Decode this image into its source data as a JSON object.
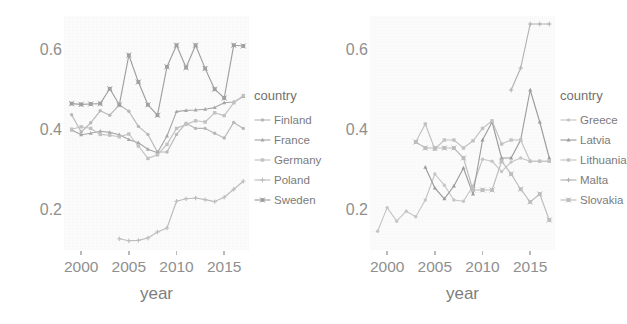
{
  "chart_data": [
    {
      "type": "line",
      "panel": "left",
      "title": "",
      "xlabel": "year",
      "ylabel": "Proportion of female MEPs",
      "legend_title": "country",
      "legend_position": "right",
      "grid": false,
      "xlim": [
        1998.2,
        2017.6
      ],
      "ylim": [
        0.1,
        0.685
      ],
      "xticks": [
        2000,
        2005,
        2010,
        2015
      ],
      "yticks": [
        0.2,
        0.4,
        0.6
      ],
      "x": [
        1999,
        2000,
        2001,
        2002,
        2003,
        2004,
        2005,
        2006,
        2007,
        2008,
        2009,
        2010,
        2011,
        2012,
        2013,
        2014,
        2015,
        2016,
        2017
      ],
      "series": [
        {
          "name": "Finland",
          "color": "#b8b8b8",
          "marker": "circle",
          "values": [
            0.438,
            0.395,
            0.418,
            0.448,
            0.437,
            0.463,
            0.447,
            0.409,
            0.389,
            0.345,
            0.345,
            0.389,
            0.417,
            0.404,
            0.404,
            0.392,
            0.38,
            0.419,
            0.404
          ]
        },
        {
          "name": "France",
          "color": "#a8a8a8",
          "marker": "triangle",
          "values": [
            0.4,
            0.388,
            0.392,
            0.397,
            0.394,
            0.388,
            0.376,
            0.368,
            0.352,
            0.343,
            0.385,
            0.446,
            0.449,
            0.45,
            0.452,
            0.456,
            0.468,
            0.47,
            0.484
          ]
        },
        {
          "name": "Germany",
          "color": "#c2c2c2",
          "marker": "square",
          "values": [
            0.402,
            0.408,
            0.404,
            0.389,
            0.387,
            0.383,
            0.39,
            0.36,
            0.329,
            0.338,
            0.364,
            0.404,
            0.414,
            0.423,
            0.42,
            0.443,
            0.436,
            0.468,
            0.486
          ]
        },
        {
          "name": "Poland",
          "color": "#bdbdbd",
          "marker": "plus",
          "values": [
            null,
            null,
            null,
            null,
            null,
            0.128,
            0.123,
            0.124,
            0.13,
            0.145,
            0.155,
            0.222,
            0.228,
            0.23,
            0.226,
            0.221,
            0.232,
            0.252,
            0.272
          ]
        },
        {
          "name": "Sweden",
          "color": "#a0a0a0",
          "marker": "square-cross",
          "values": [
            0.466,
            0.464,
            0.465,
            0.466,
            0.503,
            0.463,
            0.587,
            0.52,
            0.463,
            0.437,
            0.558,
            0.612,
            0.556,
            0.612,
            0.554,
            0.502,
            0.48,
            0.612,
            0.61
          ]
        }
      ]
    },
    {
      "type": "line",
      "panel": "right",
      "title": "",
      "xlabel": "year",
      "ylabel": "Proportion of female MEPs",
      "legend_title": "country",
      "legend_position": "right",
      "grid": false,
      "xlim": [
        1998.2,
        2017.6
      ],
      "ylim": [
        0.1,
        0.685
      ],
      "xticks": [
        2000,
        2005,
        2010,
        2015
      ],
      "yticks": [
        0.2,
        0.4,
        0.6
      ],
      "x": [
        1999,
        2000,
        2001,
        2002,
        2003,
        2004,
        2005,
        2006,
        2007,
        2008,
        2009,
        2010,
        2011,
        2012,
        2013,
        2014,
        2015,
        2016,
        2017
      ],
      "series": [
        {
          "name": "Greece",
          "color": "#c6c6c6",
          "marker": "circle",
          "values": [
            0.147,
            0.206,
            0.172,
            0.197,
            0.183,
            0.225,
            0.29,
            0.262,
            0.225,
            0.222,
            0.26,
            0.327,
            0.322,
            0.296,
            0.32,
            0.33,
            0.322,
            0.322,
            0.322
          ]
        },
        {
          "name": "Latvia",
          "color": "#9d9d9d",
          "marker": "triangle",
          "values": [
            null,
            null,
            null,
            null,
            null,
            0.307,
            0.255,
            0.228,
            0.26,
            0.305,
            0.24,
            0.375,
            0.42,
            0.33,
            0.33,
            0.375,
            0.5,
            0.42,
            0.33
          ]
        },
        {
          "name": "Lithuania",
          "color": "#c2c2c2",
          "marker": "square",
          "values": [
            null,
            null,
            null,
            null,
            0.37,
            0.415,
            0.352,
            0.375,
            0.375,
            0.355,
            0.373,
            0.404,
            0.423,
            0.365,
            0.375,
            0.375,
            0.322,
            0.322,
            0.322
          ]
        },
        {
          "name": "Malta",
          "color": "#b2b2b2",
          "marker": "plus",
          "values": [
            null,
            null,
            null,
            null,
            null,
            null,
            null,
            null,
            null,
            null,
            null,
            null,
            null,
            null,
            0.5,
            0.555,
            0.665,
            0.665,
            0.665
          ]
        },
        {
          "name": "Slovakia",
          "color": "#bdbdbd",
          "marker": "square-cross",
          "values": [
            null,
            null,
            null,
            null,
            0.37,
            0.355,
            0.355,
            0.355,
            0.355,
            0.33,
            0.25,
            0.25,
            0.25,
            0.322,
            0.29,
            0.252,
            0.22,
            0.24,
            0.175
          ]
        }
      ]
    }
  ],
  "panels": [
    {
      "id": "left-panel",
      "axis": {
        "y_title": "Proportion of female MEPs",
        "x_title": "year",
        "y_ticks": [
          "0.6",
          "0.4",
          "0.2"
        ],
        "x_ticks": [
          "2000",
          "2005",
          "2010",
          "2015"
        ]
      },
      "legend": {
        "title": "country",
        "items": [
          {
            "label": "Finland",
            "color": "#b8b8b8",
            "marker": "circle"
          },
          {
            "label": "France",
            "color": "#a8a8a8",
            "marker": "triangle"
          },
          {
            "label": "Germany",
            "color": "#c2c2c2",
            "marker": "square"
          },
          {
            "label": "Poland",
            "color": "#bdbdbd",
            "marker": "plus"
          },
          {
            "label": "Sweden",
            "color": "#a0a0a0",
            "marker": "square-cross"
          }
        ]
      }
    },
    {
      "id": "right-panel",
      "axis": {
        "y_title": "Proportion of female MEPs",
        "x_title": "year",
        "y_ticks": [
          "0.6",
          "0.4",
          "0.2"
        ],
        "x_ticks": [
          "2000",
          "2005",
          "2010",
          "2015"
        ]
      },
      "legend": {
        "title": "country",
        "items": [
          {
            "label": "Greece",
            "color": "#c6c6c6",
            "marker": "circle"
          },
          {
            "label": "Latvia",
            "color": "#9d9d9d",
            "marker": "triangle"
          },
          {
            "label": "Lithuania",
            "color": "#c2c2c2",
            "marker": "square"
          },
          {
            "label": "Malta",
            "color": "#b2b2b2",
            "marker": "plus"
          },
          {
            "label": "Slovakia",
            "color": "#bdbdbd",
            "marker": "square-cross"
          }
        ]
      }
    }
  ],
  "style": {
    "panel_background": "#fbfbfb",
    "text_color": "#8a8a8a",
    "tick_color": "#b4b4b4"
  }
}
